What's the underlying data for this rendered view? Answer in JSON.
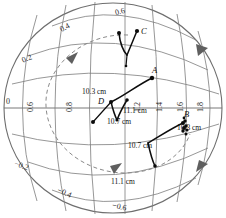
{
  "figure": {
    "type": "stereographic-pole-figure",
    "colors": {
      "grid": "#7c7c7c",
      "outline": "#6e6e6e",
      "trace": "#0d0d0d",
      "dashed": "#8a8a8a",
      "background": "#ffffff"
    }
  },
  "axis_labels": {
    "upper_arc": [
      {
        "text": "0.2",
        "x": 22,
        "y": 55,
        "rotate": -22
      },
      {
        "text": "0.4",
        "x": 60,
        "y": 24,
        "rotate": -28
      },
      {
        "text": "0.6",
        "x": 115,
        "y": 8,
        "rotate": -14
      }
    ],
    "lower_arc": [
      {
        "text": "−0.2",
        "x": 14,
        "y": 162,
        "rotate": 20
      },
      {
        "text": "−0.4",
        "x": 57,
        "y": 189,
        "rotate": 24
      },
      {
        "text": "−0.6",
        "x": 112,
        "y": 203,
        "rotate": 12
      }
    ],
    "equator_origin": {
      "text": "0",
      "x": 6,
      "y": 98
    },
    "equator_vertical": [
      {
        "text": "0.6",
        "x": 27,
        "y": 112
      },
      {
        "text": "0.8",
        "x": 66,
        "y": 112
      },
      {
        "text": "1.2",
        "x": 134,
        "y": 112
      },
      {
        "text": "1.4",
        "x": 156,
        "y": 112
      },
      {
        "text": "1.6",
        "x": 177,
        "y": 112
      },
      {
        "text": "1.8",
        "x": 197,
        "y": 112
      }
    ]
  },
  "point_labels": [
    {
      "id": "A",
      "text": "A",
      "x": 152,
      "y": 73
    },
    {
      "id": "B",
      "text": "B",
      "x": 188,
      "y": 117
    },
    {
      "id": "C",
      "text": "C",
      "x": 141,
      "y": 27
    },
    {
      "id": "D",
      "text": "D",
      "x": 98,
      "y": 100
    }
  ],
  "distance_labels": [
    {
      "text": "10.3 cm",
      "x": 82,
      "y": 90
    },
    {
      "text": "11.1 cm",
      "x": 125,
      "y": 108
    },
    {
      "text": "10.7 cm",
      "x": 109,
      "y": 118
    },
    {
      "text": "10.3 cm",
      "x": 186,
      "y": 128
    },
    {
      "text": "10.7 cm",
      "x": 131,
      "y": 142
    },
    {
      "text": "11.1 cm",
      "x": 113,
      "y": 178
    }
  ]
}
